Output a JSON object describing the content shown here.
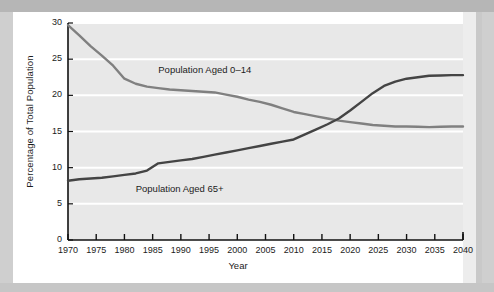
{
  "figure": {
    "background_color": "#ffffff",
    "page_color": "#c9c9c9",
    "plot_background_color": "#e8e8e8",
    "gridline_color": "#ffffff"
  },
  "chart_data": {
    "type": "line",
    "title": "",
    "xlabel": "Year",
    "ylabel": "Percentage of Total Population",
    "xlim": [
      1970,
      2040
    ],
    "ylim": [
      0,
      30
    ],
    "xticks": [
      1970,
      1975,
      1980,
      1985,
      1990,
      1995,
      2000,
      2005,
      2010,
      2015,
      2020,
      2025,
      2030,
      2035,
      2040
    ],
    "yticks": [
      0,
      5,
      10,
      15,
      20,
      25,
      30
    ],
    "xtick_labels": [
      "1970",
      "1975",
      "1980",
      "1985",
      "1990",
      "1995",
      "2000",
      "2005",
      "2010",
      "2015",
      "2020",
      "2025",
      "2030",
      "2035",
      "2040"
    ],
    "ytick_labels": [
      "0",
      "5",
      "10",
      "15",
      "20",
      "25",
      "30"
    ],
    "grid": "horizontal",
    "legend_position": "inline-annotation",
    "x": [
      1970,
      1972,
      1974,
      1976,
      1978,
      1980,
      1982,
      1984,
      1986,
      1988,
      1990,
      1992,
      1994,
      1996,
      1998,
      2000,
      2002,
      2004,
      2006,
      2008,
      2010,
      2012,
      2014,
      2016,
      2018,
      2020,
      2022,
      2024,
      2026,
      2028,
      2030,
      2032,
      2034,
      2036,
      2038,
      2040
    ],
    "series": [
      {
        "name": "Population Aged 0–14",
        "color": "#808080",
        "values": [
          29.7,
          28.3,
          26.8,
          25.5,
          24.1,
          22.3,
          21.6,
          21.2,
          21.0,
          20.8,
          20.7,
          20.6,
          20.5,
          20.4,
          20.1,
          19.8,
          19.4,
          19.1,
          18.7,
          18.2,
          17.7,
          17.4,
          17.1,
          16.8,
          16.5,
          16.3,
          16.1,
          15.9,
          15.8,
          15.7,
          15.7,
          15.65,
          15.6,
          15.65,
          15.7,
          15.7
        ]
      },
      {
        "name": "Population Aged 65+",
        "color": "#444444",
        "values": [
          8.2,
          8.4,
          8.5,
          8.6,
          8.8,
          9.0,
          9.2,
          9.6,
          10.6,
          10.8,
          11.0,
          11.2,
          11.5,
          11.8,
          12.1,
          12.4,
          12.7,
          13.0,
          13.3,
          13.6,
          13.9,
          14.6,
          15.3,
          16.0,
          16.8,
          17.9,
          19.1,
          20.3,
          21.3,
          21.9,
          22.3,
          22.5,
          22.7,
          22.75,
          22.8,
          22.8
        ]
      }
    ],
    "annotations": [
      {
        "text": "Population Aged 0–14",
        "x": 1986,
        "y": 23.4
      },
      {
        "text": "Population Aged 65+",
        "x": 1982,
        "y": 6.9
      }
    ]
  }
}
